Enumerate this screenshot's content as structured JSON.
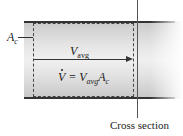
{
  "diagram": {
    "area_label": {
      "symbol": "A",
      "subscript": "c"
    },
    "velocity_label": {
      "symbol": "V",
      "subscript": "avg"
    },
    "equation": {
      "lhs": "V",
      "equals": " = ",
      "rhs_symbol1": "V",
      "rhs_sub1": "avg",
      "rhs_symbol2": "A",
      "rhs_sub2": "c"
    },
    "cross_section_label": "Cross section"
  }
}
